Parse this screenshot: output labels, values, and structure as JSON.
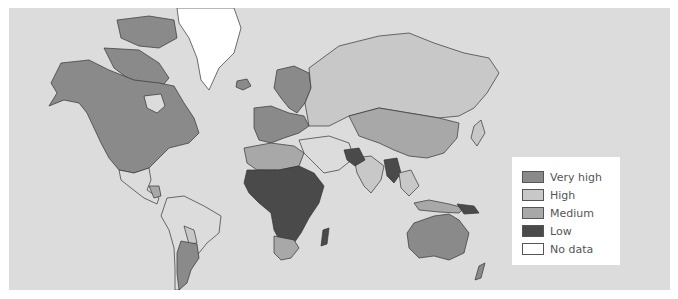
{
  "map": {
    "type": "choropleth-world",
    "background_color": "#dcdcdc",
    "categories": {
      "very_high": "#8a8a8a",
      "high": "#c8c8c8",
      "medium": "#a8a8a8",
      "low": "#4a4a4a",
      "no_data": "#ffffff"
    }
  },
  "legend": {
    "items": [
      {
        "label": "Very high",
        "color": "#8a8a8a"
      },
      {
        "label": "High",
        "color": "#c8c8c8"
      },
      {
        "label": "Medium",
        "color": "#a8a8a8"
      },
      {
        "label": "Low",
        "color": "#4a4a4a"
      },
      {
        "label": "No data",
        "color": "#ffffff"
      }
    ]
  }
}
